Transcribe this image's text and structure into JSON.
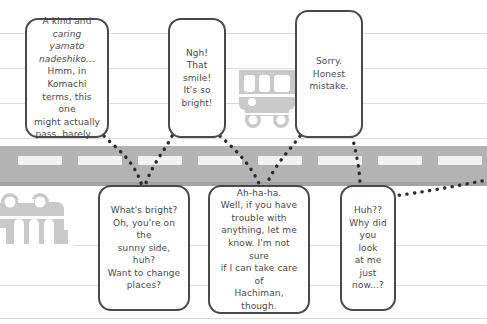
{
  "scene": {
    "width": 487,
    "height": 324,
    "setting_description": "manga panel of a street with speech balloons",
    "colors": {
      "background": "#ffffff",
      "background_line": "#dcdcdc",
      "road": "#b3b3b3",
      "road_edge_shadow": "#a3a3a3",
      "lane_marking": "#f2f2f2",
      "vehicle": "#c9c9c9",
      "balloon_fill": "#ffffff",
      "balloon_border": "#4a4a4a",
      "text": "#4a4a4a",
      "tail_dots": "#2b2b2b"
    }
  },
  "background_lines": [
    {
      "y": 33
    },
    {
      "y": 68
    },
    {
      "y": 103
    },
    {
      "y": 138
    },
    {
      "y": 245
    },
    {
      "y": 285
    },
    {
      "y": 318
    }
  ],
  "road": {
    "top": 146,
    "height": 40,
    "shadow_top": 182,
    "lane_markings": [
      {
        "x": 18,
        "y": 156,
        "width": 44
      },
      {
        "x": 78,
        "y": 156,
        "width": 44
      },
      {
        "x": 138,
        "y": 156,
        "width": 44
      },
      {
        "x": 198,
        "y": 156,
        "width": 44
      },
      {
        "x": 258,
        "y": 156,
        "width": 44
      },
      {
        "x": 318,
        "y": 156,
        "width": 44
      },
      {
        "x": 378,
        "y": 156,
        "width": 44
      },
      {
        "x": 438,
        "y": 156,
        "width": 44
      }
    ]
  },
  "vehicles": [
    {
      "name": "bus-upper",
      "x": 237,
      "y": 68,
      "width": 60,
      "height": 62
    },
    {
      "name": "bus-lower-left",
      "x": -4,
      "y": 192,
      "width": 78,
      "height": 62
    }
  ],
  "balloons": [
    {
      "name": "balloon-kind-and-caring",
      "speaker_side": "upper",
      "x": 25,
      "y": 18,
      "width": 84,
      "height": 120,
      "font_size": 9,
      "text": "A kind and\ncaring yamato\nnadeshiko...\nHmm, in Komachi\nterms, this one\nmight actually\npass, barely...",
      "italic_lines": [
        1,
        2
      ]
    },
    {
      "name": "balloon-that-smile",
      "speaker_side": "upper",
      "x": 168,
      "y": 18,
      "width": 58,
      "height": 120,
      "font_size": 9,
      "text": "Ngh!\nThat smile!\nIt's so\nbright!",
      "italic_lines": []
    },
    {
      "name": "balloon-honest-mistake",
      "speaker_side": "upper",
      "x": 295,
      "y": 10,
      "width": 68,
      "height": 128,
      "font_size": 9,
      "text": "Sorry.\nHonest\nmistake.",
      "italic_lines": []
    },
    {
      "name": "balloon-whats-bright",
      "speaker_side": "lower",
      "x": 98,
      "y": 185,
      "width": 92,
      "height": 126,
      "font_size": 9,
      "text": "What's bright?\nOh, you're on the\nsunny side, huh?\nWant to change\nplaces?",
      "italic_lines": []
    },
    {
      "name": "balloon-ah-ha-ha",
      "speaker_side": "lower",
      "x": 208,
      "y": 185,
      "width": 102,
      "height": 129,
      "font_size": 9,
      "text": "Ah-ha-ha.\nWell, if you have\ntrouble with\nanything, let me\nknow. I'm not sure\nif I can take care of\nHachiman, though.",
      "italic_lines": []
    },
    {
      "name": "balloon-why-did-you-look",
      "speaker_side": "lower",
      "x": 340,
      "y": 185,
      "width": 56,
      "height": 126,
      "font_size": 9,
      "text": "Huh??\nWhy did\nyou look\nat me\njust\nnow...?",
      "italic_lines": []
    }
  ],
  "tails": [
    {
      "name": "tail-kind-to-whats-bright",
      "path": "M 104 136 C 118 150, 134 160, 142 186"
    },
    {
      "name": "tail-smile-to-whats-bright",
      "path": "M 172 136 C 164 152, 152 164, 145 186"
    },
    {
      "name": "tail-smile-to-ahahaha",
      "path": "M 220 136 C 236 150, 252 166, 260 186"
    },
    {
      "name": "tail-mistake-to-ahahaha",
      "path": "M 300 136 C 288 152, 274 166, 266 186"
    },
    {
      "name": "tail-mistake-to-huh",
      "path": "M 352 136 C 356 152, 360 170, 360 186"
    },
    {
      "name": "tail-huh-offscreen-right",
      "path": "M 392 196 C 420 193, 456 186, 487 180"
    }
  ]
}
